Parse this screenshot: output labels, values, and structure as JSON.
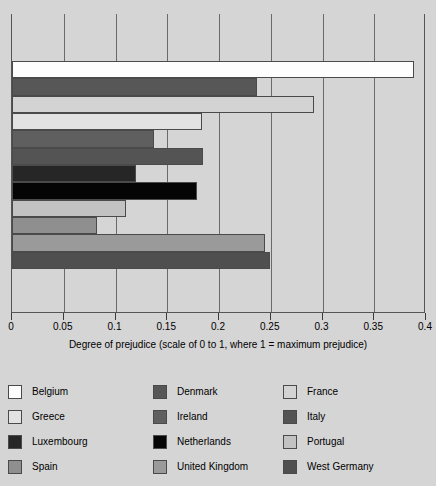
{
  "chart_data": {
    "type": "bar",
    "orientation": "horizontal",
    "title": "",
    "xlabel": "Degree of prejudice (scale of 0 to 1, where 1 = maximum prejudice)",
    "ylabel": "",
    "xlim": [
      0,
      0.4
    ],
    "xticks": [
      "0",
      "0.05",
      "0.1",
      "0.15",
      "0.2",
      "0.25",
      "0.3",
      "0.35",
      "0.4"
    ],
    "xtick_values": [
      0,
      0.05,
      0.1,
      0.15,
      0.2,
      0.25,
      0.3,
      0.35,
      0.4
    ],
    "grid": true,
    "grid_axis": "x",
    "legend_position": "bottom",
    "legend_columns": 3,
    "categories": [
      "Belgium",
      "Denmark",
      "France",
      "Greece",
      "Ireland",
      "Italy",
      "Luxembourg",
      "Netherlands",
      "Portugal",
      "Spain",
      "United Kingdom",
      "West Germany"
    ],
    "values": [
      0.388,
      0.237,
      0.292,
      0.184,
      0.137,
      0.185,
      0.12,
      0.179,
      0.11,
      0.082,
      0.244,
      0.249
    ],
    "colors": [
      "#fdfdfd",
      "#575757",
      "#d3d3d3",
      "#e2e2e2",
      "#5f5f5f",
      "#545454",
      "#262626",
      "#050505",
      "#c2c2c2",
      "#8f8f8f",
      "#9a9a9a",
      "#4f4f4f"
    ]
  },
  "legend": {
    "columns": [
      [
        {
          "label": "Belgium",
          "color": "#fdfdfd"
        },
        {
          "label": "Greece",
          "color": "#e2e2e2"
        },
        {
          "label": "Luxembourg",
          "color": "#262626"
        },
        {
          "label": "Spain",
          "color": "#8f8f8f"
        }
      ],
      [
        {
          "label": "Denmark",
          "color": "#575757"
        },
        {
          "label": "Ireland",
          "color": "#5f5f5f"
        },
        {
          "label": "Netherlands",
          "color": "#050505"
        },
        {
          "label": "United Kingdom",
          "color": "#9a9a9a"
        }
      ],
      [
        {
          "label": "France",
          "color": "#d3d3d3"
        },
        {
          "label": "Italy",
          "color": "#545454"
        },
        {
          "label": "Portugal",
          "color": "#c2c2c2"
        },
        {
          "label": "West Germany",
          "color": "#4f4f4f"
        }
      ]
    ]
  },
  "style": {
    "background": "#d5d5d5",
    "axis_color": "#555555",
    "grid_color": "#6a6a6a",
    "bar_border": "#4a4a4a"
  }
}
